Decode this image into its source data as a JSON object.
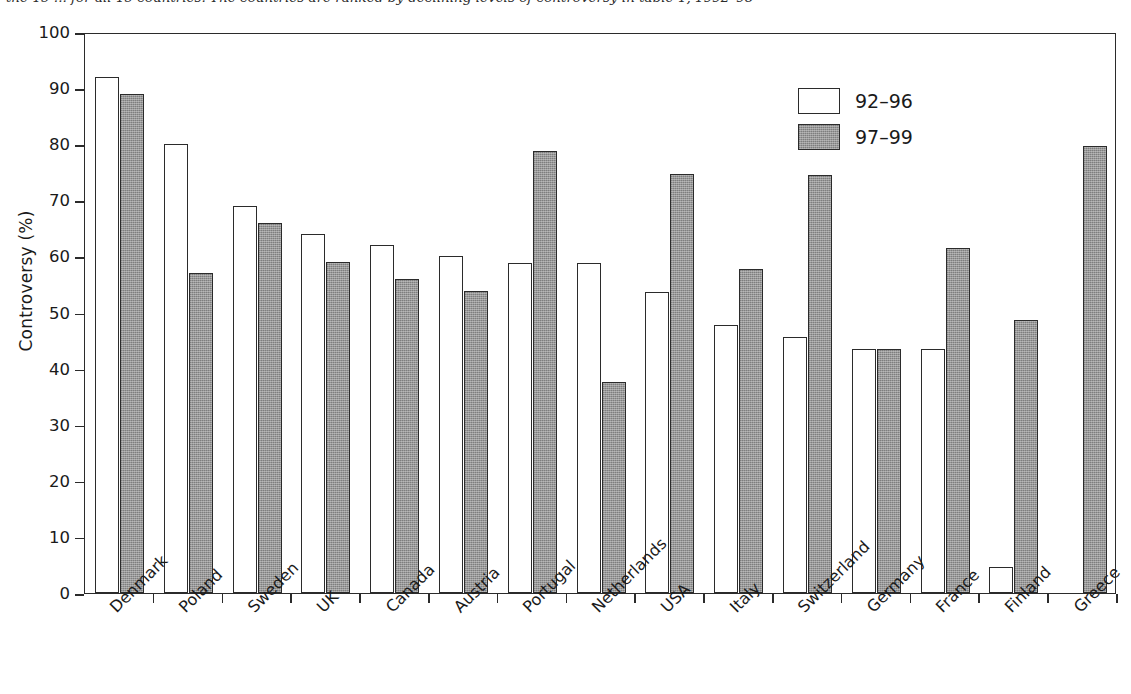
{
  "caption": "the 15 ... for all 15 countries. The countries are ranked by declining levels of controversy in table 1, 1992–98",
  "chart_data": {
    "type": "bar",
    "title": "",
    "xlabel": "",
    "ylabel": "Controversy (%)",
    "ylim": [
      0,
      100
    ],
    "ytick_step": 10,
    "yticks": [
      0,
      10,
      20,
      30,
      40,
      50,
      60,
      70,
      80,
      90,
      100
    ],
    "grid": false,
    "legend_position": "top-right",
    "categories": [
      "Denmark",
      "Poland",
      "Sweden",
      "UK",
      "Canada",
      "Austria",
      "Portugal",
      "Netherlands",
      "USA",
      "Italy",
      "Switzerland",
      "Germany",
      "France",
      "Finland",
      "Greece"
    ],
    "series": [
      {
        "name": "92–96",
        "style": "open",
        "color": "#ffffff",
        "values": [
          92.0,
          80.0,
          69.0,
          64.0,
          62.0,
          60.0,
          58.8,
          58.8,
          53.7,
          47.7,
          45.7,
          43.5,
          43.5,
          4.7,
          0.0
        ]
      },
      {
        "name": "97–99",
        "style": "filled",
        "color": "#8c8c8c",
        "values": [
          89.0,
          57.0,
          66.0,
          59.0,
          56.0,
          53.8,
          78.8,
          37.7,
          74.7,
          57.7,
          74.6,
          43.5,
          61.5,
          48.6,
          79.6
        ]
      }
    ]
  }
}
